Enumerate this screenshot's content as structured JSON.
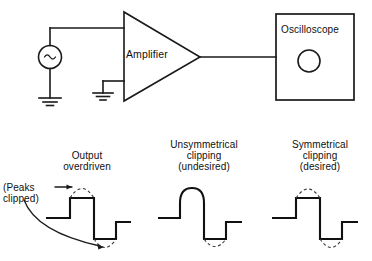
{
  "figure": {
    "kind": "amplifier-clipping-diagram",
    "line_color": "#1a1a1a",
    "dash_color": "#3a3a3a",
    "background": "#ffffff"
  },
  "circuit": {
    "source": {
      "icon": "ac-source-icon",
      "symbol": "∿"
    },
    "amplifier": {
      "label": "Amplifier",
      "shape": "triangle",
      "inputs": 2,
      "outputs": 1
    },
    "oscilloscope": {
      "label": "Oscilloscope",
      "screen_icon": "scope-screen-circle-icon"
    },
    "grounds": [
      {
        "name": "source-ground-icon"
      },
      {
        "name": "amplifier-ground-icon"
      }
    ]
  },
  "waveforms": [
    {
      "id": "output-overdriven",
      "caption": "Output\noverdriven",
      "note": "(Peaks\nclipped)",
      "top_clipped": true,
      "bottom_clipped": true,
      "dashed_arc_top": true,
      "dashed_arc_bottom": true,
      "annotation_arrows": 2
    },
    {
      "id": "unsymmetrical-clipping",
      "caption": "Unsymmetrical\nclipping\n(undesired)",
      "top_clipped": false,
      "bottom_clipped": true,
      "dashed_arc_top": false,
      "dashed_arc_bottom": true,
      "annotation_arrows": 0
    },
    {
      "id": "symmetrical-clipping",
      "caption": "Symmetrical\nclipping\n(desired)",
      "top_clipped": true,
      "bottom_clipped": true,
      "dashed_arc_top": true,
      "dashed_arc_bottom": true,
      "annotation_arrows": 0
    }
  ]
}
